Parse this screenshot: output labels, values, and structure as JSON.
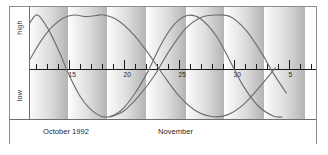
{
  "axes": {
    "ylabel_high": "high",
    "ylabel_low": "low",
    "month_left": "October 1992",
    "month_right": "November"
  },
  "chart_data": {
    "type": "line",
    "title": "",
    "xlabel": "",
    "ylabel": "tide height",
    "grid": false,
    "legend": "none",
    "ylim": [
      -1,
      1
    ],
    "ytick_labels": [
      "high",
      "low"
    ],
    "xlim": [
      11.5,
      37.5
    ],
    "x_tick_labels": [
      "15",
      "20",
      "25",
      "30",
      "5"
    ],
    "x_tick_values": [
      15,
      20,
      25,
      30,
      35
    ],
    "x_minor_interval": 1,
    "x_axis_note": "day of month; values past 31 continue into November (35 = Nov 5)",
    "shaded_bands": [
      {
        "start": 11.5,
        "end": 15.1
      },
      {
        "start": 15.1,
        "end": 18.6
      },
      {
        "start": 18.6,
        "end": 22.2
      },
      {
        "start": 22.2,
        "end": 25.8
      },
      {
        "start": 25.8,
        "end": 29.3
      },
      {
        "start": 29.3,
        "end": 32.9
      },
      {
        "start": 32.9,
        "end": 36.6
      }
    ],
    "series": [
      {
        "name": "long-period tide",
        "form": "sinusoid",
        "amplitude": 1.0,
        "period_days": 14.2,
        "phase_peak_day": 18.2,
        "points": [
          {
            "x": 11.5,
            "y": 0.18
          },
          {
            "x": 12.5,
            "y": 0.52
          },
          {
            "x": 13.5,
            "y": 0.78
          },
          {
            "x": 14.5,
            "y": 0.94
          },
          {
            "x": 15.5,
            "y": 1.0
          },
          {
            "x": 16.5,
            "y": 0.97
          },
          {
            "x": 17.5,
            "y": 0.99
          },
          {
            "x": 18.2,
            "y": 1.0
          },
          {
            "x": 19.5,
            "y": 0.9
          },
          {
            "x": 21.0,
            "y": 0.62
          },
          {
            "x": 22.5,
            "y": 0.22
          },
          {
            "x": 23.6,
            "y": -0.12
          },
          {
            "x": 25.0,
            "y": -0.55
          },
          {
            "x": 26.5,
            "y": -0.86
          },
          {
            "x": 28.0,
            "y": -0.99
          },
          {
            "x": 29.5,
            "y": -0.95
          },
          {
            "x": 31.0,
            "y": -0.72
          },
          {
            "x": 32.5,
            "y": -0.34
          },
          {
            "x": 33.8,
            "y": 0.02
          }
        ]
      },
      {
        "name": "short-period tide",
        "form": "sinusoid",
        "amplitude": 1.0,
        "period_days": 12.6,
        "phase_peak_day": 12.2,
        "points": [
          {
            "x": 11.5,
            "y": 0.86
          },
          {
            "x": 12.2,
            "y": 1.0
          },
          {
            "x": 13.2,
            "y": 0.72
          },
          {
            "x": 14.2,
            "y": 0.3
          },
          {
            "x": 15.0,
            "y": -0.1
          },
          {
            "x": 16.2,
            "y": -0.62
          },
          {
            "x": 17.5,
            "y": -0.93
          },
          {
            "x": 18.6,
            "y": -1.0
          },
          {
            "x": 19.8,
            "y": -0.86
          },
          {
            "x": 21.0,
            "y": -0.52
          },
          {
            "x": 22.2,
            "y": -0.06
          },
          {
            "x": 23.4,
            "y": 0.45
          },
          {
            "x": 24.6,
            "y": 0.82
          },
          {
            "x": 25.8,
            "y": 0.99
          },
          {
            "x": 27.0,
            "y": 0.93
          },
          {
            "x": 28.4,
            "y": 0.62
          },
          {
            "x": 29.6,
            "y": 0.18
          },
          {
            "x": 30.8,
            "y": -0.32
          },
          {
            "x": 32.2,
            "y": -0.76
          },
          {
            "x": 33.6,
            "y": -0.98
          },
          {
            "x": 34.4,
            "y": -1.0
          }
        ]
      },
      {
        "name": "third-period tide",
        "form": "sinusoid",
        "amplitude": 1.0,
        "period_days": 13.4,
        "phase_peak_day": 29.6,
        "points": [
          {
            "x": 18.8,
            "y": -1.0
          },
          {
            "x": 20.0,
            "y": -0.88
          },
          {
            "x": 21.4,
            "y": -0.56
          },
          {
            "x": 22.8,
            "y": -0.14
          },
          {
            "x": 24.2,
            "y": 0.35
          },
          {
            "x": 25.6,
            "y": 0.74
          },
          {
            "x": 27.0,
            "y": 0.95
          },
          {
            "x": 28.4,
            "y": 1.0
          },
          {
            "x": 29.8,
            "y": 0.96
          },
          {
            "x": 31.2,
            "y": 0.7
          },
          {
            "x": 32.6,
            "y": 0.28
          },
          {
            "x": 33.6,
            "y": -0.08
          },
          {
            "x": 34.8,
            "y": -0.5
          }
        ]
      }
    ]
  },
  "colors": {
    "curve": "#6e6e6e",
    "axis": "#1a1a1a",
    "frame": "#8d8d8d",
    "band_light": "#fbfbfb",
    "band_dark": "#b4b4b4",
    "text": "#1f1f1f"
  }
}
